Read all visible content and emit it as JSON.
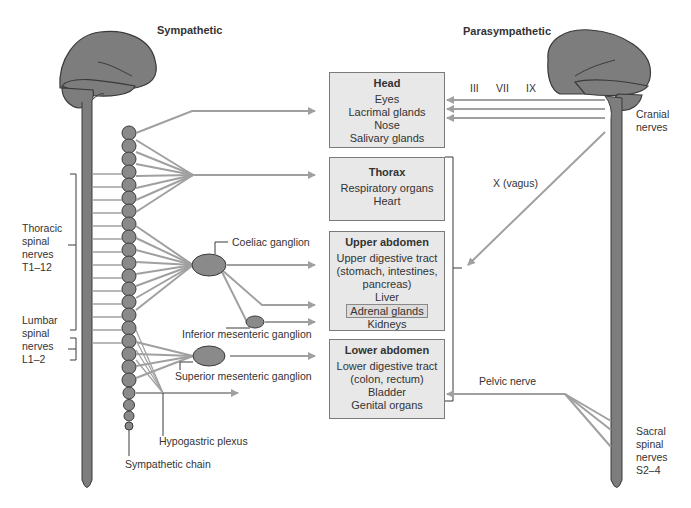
{
  "titles": {
    "sympathetic": "Sympathetic",
    "parasympathetic": "Parasympathetic"
  },
  "organs": [
    {
      "heading": "Head",
      "items": [
        "Eyes",
        "Lacrimal glands",
        "Nose",
        "Salivary glands"
      ]
    },
    {
      "heading": "Thorax",
      "items": [
        "Respiratory organs",
        "Heart"
      ]
    },
    {
      "heading": "Upper abdomen",
      "items": [
        "Upper digestive tract",
        "(stomach, intestines,",
        "pancreas)",
        "Liver",
        "Adrenal glands",
        "Kidneys"
      ]
    },
    {
      "heading": "Lower abdomen",
      "items": [
        "Lower digestive tract",
        "(colon, rectum)",
        "Bladder",
        "Genital organs"
      ]
    }
  ],
  "sympathetic_labels": {
    "thoracic": [
      "Thoracic",
      "spinal",
      "nerves",
      "T1–12"
    ],
    "lumbar": [
      "Lumbar",
      "spinal",
      "nerves",
      "L1–2"
    ],
    "coeliac": "Coeliac ganglion",
    "inferior_mesenteric": "Inferior mesenteric ganglion",
    "superior_mesenteric": "Superior mesenteric ganglion",
    "hypogastric": "Hypogastric plexus",
    "chain": "Sympathetic chain"
  },
  "parasympathetic_labels": {
    "cranial_numerals": [
      "III",
      "VII",
      "IX"
    ],
    "cranial": [
      "Cranial",
      "nerves"
    ],
    "vagus": "X (vagus)",
    "pelvic": "Pelvic nerve",
    "sacral": [
      "Sacral",
      "spinal",
      "nerves",
      "S2–4"
    ]
  },
  "colors": {
    "nerve": "#a0a0a0",
    "tissue": "#7d7d7d",
    "outline": "#3a3a3a",
    "box_fill": "#e8e8e8",
    "box_border": "#7a7a7a"
  }
}
